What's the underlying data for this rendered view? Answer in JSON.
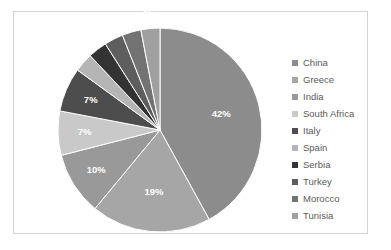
{
  "chart_data": {
    "type": "pie",
    "title": "",
    "labels": [
      "China",
      "Greece",
      "India",
      "South Africa",
      "Italy",
      "Spain",
      "Serbia",
      "Turkey",
      "Morocco",
      "Tunisia"
    ],
    "values": [
      42,
      19,
      10,
      7,
      7,
      3,
      3,
      3,
      3,
      3
    ],
    "value_labels": [
      "42%",
      "19%",
      "10%",
      "7%",
      "7%",
      "3%",
      "3%",
      "3%",
      "3%",
      "3%"
    ],
    "colors": [
      "#8c8c8c",
      "#a6a6a6",
      "#999999",
      "#c9c9c9",
      "#4d4d4d",
      "#b5b5b5",
      "#333333",
      "#5e5e5e",
      "#737373",
      "#a0a0a0"
    ],
    "start_angle": 0,
    "direction": "clockwise",
    "legend_position": "right",
    "grid": false,
    "label_color": "#ffffff"
  },
  "frame": {
    "border_color": "#d4d4d4",
    "background": "#ffffff"
  },
  "legend": {
    "entries": [
      {
        "label": "China",
        "color": "#8c8c8c"
      },
      {
        "label": "Greece",
        "color": "#a6a6a6"
      },
      {
        "label": "India",
        "color": "#999999"
      },
      {
        "label": "South Africa",
        "color": "#c9c9c9"
      },
      {
        "label": "Italy",
        "color": "#4d4d4d"
      },
      {
        "label": "Spain",
        "color": "#b5b5b5"
      },
      {
        "label": "Serbia",
        "color": "#333333"
      },
      {
        "label": "Turkey",
        "color": "#5e5e5e"
      },
      {
        "label": "Morocco",
        "color": "#737373"
      },
      {
        "label": "Tunisia",
        "color": "#a0a0a0"
      }
    ]
  }
}
